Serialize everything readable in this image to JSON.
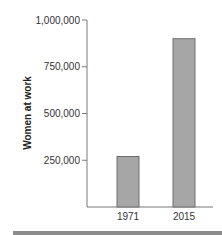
{
  "chart_data": {
    "type": "bar",
    "title": "",
    "xlabel": "",
    "ylabel": "Women at work",
    "categories": [
      "1971",
      "2015"
    ],
    "values": [
      270000,
      900000
    ],
    "ylim": [
      0,
      1000000
    ],
    "yticks": [
      250000,
      500000,
      750000,
      1000000
    ],
    "ytick_labels": [
      "250,000",
      "500,000",
      "750,000",
      "1,000,000"
    ],
    "grid": false,
    "legend": "none",
    "colors": {
      "bar_fill": "#a6a6a6",
      "bar_stroke": "#6e6e6e",
      "axis": "#7a7a7a",
      "footer": "#8c8c8c"
    }
  }
}
